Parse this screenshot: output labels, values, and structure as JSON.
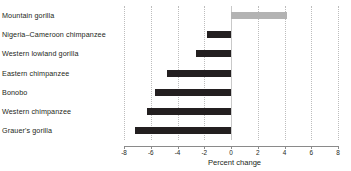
{
  "chart_data": {
    "type": "bar",
    "orientation": "horizontal",
    "title": "",
    "xlabel": "Percent change",
    "ylabel": "",
    "xlim": [
      -8,
      8
    ],
    "xticks": [
      -8,
      -6,
      -4,
      -2,
      0,
      2,
      4,
      6,
      8
    ],
    "xtick_labels": [
      "-8",
      "-6",
      "-4",
      "-2",
      "0",
      "2",
      "4",
      "6",
      "8"
    ],
    "grid": true,
    "grid_style": "dotted-vertical",
    "legend": "none",
    "categories": [
      "Mountain gorilla",
      "Nigeria–Cameroon chimpanzee",
      "Western lowland gorilla",
      "Eastern chimpanzee",
      "Bonobo",
      "Western chimpanzee",
      "Grauer's gorilla"
    ],
    "values": [
      4.2,
      -1.8,
      -2.6,
      -4.8,
      -5.7,
      -6.3,
      -7.2
    ],
    "colors": {
      "positive": "#b3b3b3",
      "negative": "#231f20",
      "gridline": "#bdbdbd",
      "axis": "#8a8a8a",
      "text": "#231f20"
    }
  }
}
